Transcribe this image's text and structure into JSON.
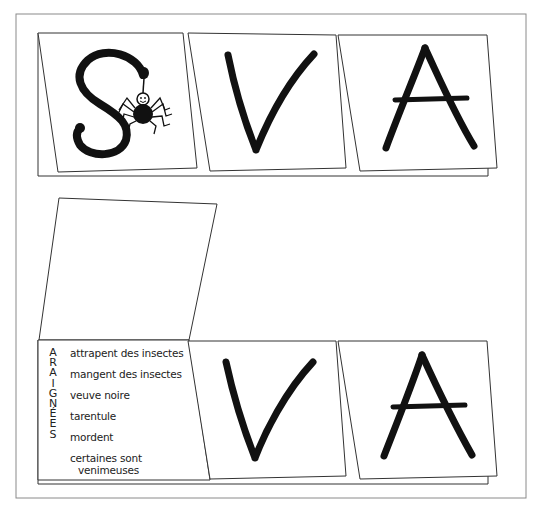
{
  "worksheet": {
    "top_row": {
      "cards": [
        {
          "letter": "S",
          "illustration": "spider hanging from letter S"
        },
        {
          "letter": "V"
        },
        {
          "letter": "A"
        }
      ]
    },
    "bottom_row": {
      "blank_flap": "",
      "acrostic_word_letters": [
        "A",
        "R",
        "A",
        "I",
        "G",
        "N",
        "É",
        "E",
        "S"
      ],
      "facts": [
        "attrapent des insectes",
        "mangent des insectes",
        "veuve noire",
        "tarentule",
        "mordent",
        "certaines sont",
        "venimeuses"
      ],
      "cards": [
        {
          "letter": "V"
        },
        {
          "letter": "A"
        }
      ]
    },
    "colors": {
      "line": "#333333",
      "ink": "#111111",
      "paper": "#ffffff",
      "outer_border": "#888888"
    }
  }
}
